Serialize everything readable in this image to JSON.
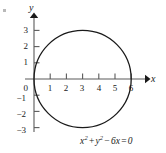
{
  "figure": {
    "kind": "coordinate-graph",
    "background_color": "#ffffff",
    "stroke_color": "#1a1a1a",
    "axis_color": "#5a5a5a",
    "corner_mark_color": "#b9b9b9",
    "equation": {
      "full_text": "x² + y² − 6x = 0",
      "term_x": "x",
      "exp_x": "2",
      "op_plus": "+",
      "term_y": "y",
      "exp_y": "2",
      "op_minus": "−",
      "term_6x": "6x",
      "op_equals": "=",
      "rhs": "0"
    }
  },
  "axes": {
    "x_label": "x",
    "y_label": "y",
    "x_ticks": [
      {
        "value": 1,
        "label": "1"
      },
      {
        "value": 2,
        "label": "2"
      },
      {
        "value": 3,
        "label": "3"
      },
      {
        "value": 4,
        "label": "4"
      },
      {
        "value": 5,
        "label": "5"
      },
      {
        "value": 6,
        "label": "6"
      }
    ],
    "y_ticks": [
      {
        "value": 3,
        "label": "3"
      },
      {
        "value": 2,
        "label": "2"
      },
      {
        "value": 1,
        "label": "1"
      },
      {
        "value": 0,
        "label": "0"
      },
      {
        "value": -1,
        "label": "−1"
      },
      {
        "value": -2,
        "label": "−2"
      },
      {
        "value": -3,
        "label": "−3"
      }
    ],
    "origin_px": {
      "x": 34,
      "y": 79
    },
    "unit_px": 16.2,
    "x_range": [
      -0.4,
      6.8
    ],
    "y_range": [
      -3.6,
      3.9
    ]
  },
  "chart_data": {
    "type": "line",
    "title": "",
    "subtitle": "",
    "xlabel": "x",
    "ylabel": "y",
    "xlim": [
      -0.4,
      6.8
    ],
    "ylim": [
      -3.6,
      3.9
    ],
    "grid": false,
    "legend": null,
    "xticks": [
      1,
      2,
      3,
      4,
      5,
      6
    ],
    "xticklabels": [
      "1",
      "2",
      "3",
      "4",
      "5",
      "6"
    ],
    "yticks": [
      -3,
      -2,
      -1,
      0,
      1,
      2,
      3
    ],
    "yticklabels": [
      "−3",
      "−2",
      "−1",
      "0",
      "1",
      "2",
      "3"
    ],
    "annotations": [
      {
        "text": "x² + y² − 6x = 0",
        "x": 4.4,
        "y": -3.4
      }
    ],
    "series": [
      {
        "name": "x² + y² − 6x = 0",
        "shape": "circle",
        "center": [
          3,
          0
        ],
        "radius": 3,
        "x_intercepts": [
          0,
          6
        ],
        "top_point": [
          3,
          3
        ],
        "bottom_point": [
          3,
          -3
        ],
        "color": "#1a1a1a",
        "linewidth": 1.3
      }
    ]
  }
}
